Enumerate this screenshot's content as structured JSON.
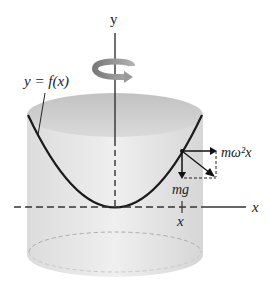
{
  "diagram": {
    "labels": {
      "y_axis": "y",
      "x_axis": "x",
      "curve": "y = f(x)",
      "centrifugal_force": "mω²x",
      "gravity_force": "mg",
      "x_position": "x"
    },
    "colors": {
      "cylinder_fill": "#e9e9e9",
      "cylinder_top": "#cfcfcf",
      "curve": "#1a1a1a",
      "axis": "#333333",
      "rotation_arrow": "#8a8a8a"
    }
  }
}
